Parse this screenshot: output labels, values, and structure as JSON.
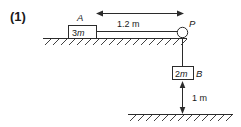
{
  "figure": {
    "index_label": "(1)",
    "type": "pulley-system-diagram"
  },
  "labels": {
    "point_a": "A",
    "point_p": "P",
    "point_b": "B",
    "block_a_mass": "3m",
    "block_b_mass": "2m"
  },
  "dimensions": {
    "horizontal_distance": "1.2 m",
    "vertical_drop": "1 m"
  },
  "colors": {
    "ink": "#2b2b2b",
    "paper": "#ffffff"
  },
  "icons": {
    "pulley": "pulley-circle-icon",
    "ground_top": "hatched-ground-icon",
    "ground_bottom": "hatched-ground-icon",
    "dim_arrow_horizontal": "double-arrow-horizontal-icon",
    "dim_arrow_vertical": "double-arrow-vertical-icon"
  }
}
